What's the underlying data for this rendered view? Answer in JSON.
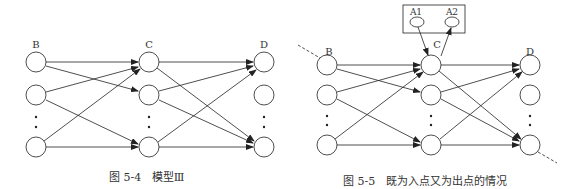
{
  "figure_left": {
    "caption_num": "图 5-4",
    "caption_text": "模型Ⅲ",
    "layers": [
      {
        "label": "B",
        "x": 36,
        "nodes_y": [
          62,
          95,
          147
        ]
      },
      {
        "label": "C",
        "x": 149,
        "nodes_y": [
          62,
          95,
          147
        ]
      },
      {
        "label": "D",
        "x": 264,
        "nodes_y": [
          62,
          95,
          147
        ]
      }
    ]
  },
  "figure_right": {
    "caption_num": "图 5-5",
    "caption_text": "既为入点又为出点的情况",
    "box_labels": [
      "A1",
      "A2"
    ],
    "layers": [
      {
        "label": "B",
        "x": 327,
        "nodes_y": [
          65,
          95,
          145
        ]
      },
      {
        "label": "C",
        "x": 431,
        "nodes_y": [
          65,
          95,
          145
        ]
      },
      {
        "label": "D",
        "x": 530,
        "nodes_y": [
          65,
          95,
          145
        ]
      }
    ]
  },
  "colors": {
    "stroke": "#222222",
    "text": "#333333"
  }
}
